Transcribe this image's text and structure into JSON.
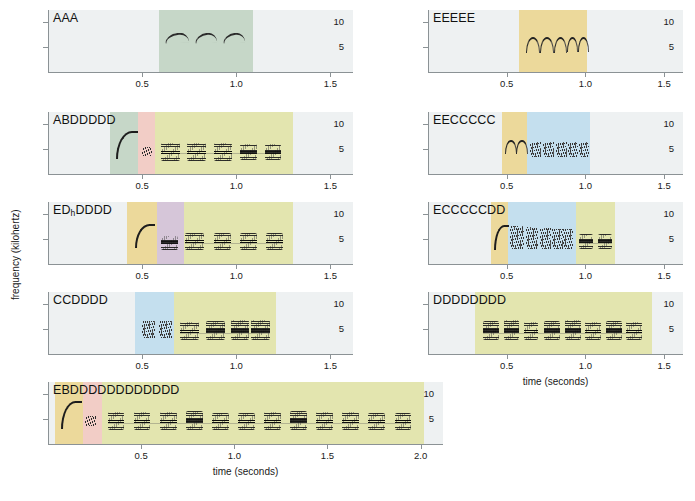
{
  "figure": {
    "xlabel": "time (seconds)",
    "ylabel": "frequency (kilohertz)",
    "y_ticks": [
      "10",
      "5"
    ],
    "x_ticks_short": [
      "0.5",
      "1.0",
      "1.5"
    ],
    "x_ticks_long": [
      "0.5",
      "1.0",
      "1.5",
      "2.0"
    ]
  },
  "colors": {
    "background": "#eef1f2",
    "A": "#c6d7c8",
    "B": "#f2cdc6",
    "C": "#c4dfee",
    "D": "#e3e5af",
    "Dh": "#d6c6d9",
    "E": "#ecd99b",
    "axis": "#8b9295",
    "ink": "#222222"
  },
  "chart_data": {
    "type": "heatmap",
    "title": "",
    "xlabel": "time (seconds)",
    "ylabel": "frequency (kilohertz)",
    "ylim": [
      0,
      12
    ],
    "grid": false,
    "legend": "none",
    "panels": [
      {
        "id": "panel-aaa",
        "label": "AAA",
        "column": "left",
        "row": 1,
        "xlim": [
          0,
          1.62
        ],
        "x_ticks": [
          0.5,
          1.0,
          1.5
        ],
        "y_ticks": [
          10,
          5
        ],
        "syllables": [
          {
            "type": "A",
            "start": 0.62,
            "end": 0.74,
            "freq_low": 6.2,
            "freq_high": 7.8
          },
          {
            "type": "A",
            "start": 0.78,
            "end": 0.89,
            "freq_low": 6.2,
            "freq_high": 7.8
          },
          {
            "type": "A",
            "start": 0.93,
            "end": 1.04,
            "freq_low": 6.2,
            "freq_high": 7.8
          }
        ],
        "regions": [
          {
            "type": "A",
            "start": 0.59,
            "end": 1.09,
            "color": "#c6d7c8"
          }
        ]
      },
      {
        "id": "panel-eeeee",
        "label": "EEEEE",
        "column": "right",
        "row": 1,
        "xlim": [
          0,
          1.62
        ],
        "x_ticks": [
          0.5,
          1.0,
          1.5
        ],
        "y_ticks": [
          10,
          5
        ],
        "syllables": [
          {
            "type": "E",
            "start": 0.62,
            "end": 0.7,
            "freq_low": 4.2,
            "freq_high": 7.0
          },
          {
            "type": "E",
            "start": 0.71,
            "end": 0.79,
            "freq_low": 4.2,
            "freq_high": 7.0
          },
          {
            "type": "E",
            "start": 0.8,
            "end": 0.87,
            "freq_low": 4.2,
            "freq_high": 7.0
          },
          {
            "type": "E",
            "start": 0.88,
            "end": 0.94,
            "freq_low": 4.4,
            "freq_high": 7.0
          },
          {
            "type": "E",
            "start": 0.95,
            "end": 1.01,
            "freq_low": 4.4,
            "freq_high": 7.0
          }
        ],
        "regions": [
          {
            "type": "E",
            "start": 0.58,
            "end": 1.01,
            "color": "#ecd99b"
          }
        ]
      },
      {
        "id": "panel-abddddd",
        "label": "ABDDDDD",
        "column": "left",
        "row": 2,
        "xlim": [
          0,
          1.62
        ],
        "x_ticks": [
          0.5,
          1.0,
          1.5
        ],
        "y_ticks": [
          10,
          5
        ],
        "syllables": [
          {
            "type": "Along",
            "start": 0.36,
            "end": 0.47,
            "freq_low": 3.4,
            "freq_high": 8.6
          },
          {
            "type": "B",
            "start": 0.5,
            "end": 0.55,
            "freq_low": 3.6,
            "freq_high": 5.4
          },
          {
            "type": "D",
            "start": 0.6,
            "end": 0.7,
            "freq_low": 2.6,
            "freq_high": 6.3
          },
          {
            "type": "D",
            "start": 0.74,
            "end": 0.84,
            "freq_low": 2.6,
            "freq_high": 6.3
          },
          {
            "type": "D",
            "start": 0.88,
            "end": 0.98,
            "freq_low": 2.6,
            "freq_high": 6.3
          },
          {
            "type": "D",
            "start": 1.02,
            "end": 1.11,
            "freq_low": 2.8,
            "freq_high": 6.0
          },
          {
            "type": "D",
            "start": 1.15,
            "end": 1.24,
            "freq_low": 2.8,
            "freq_high": 6.0
          }
        ],
        "regions": [
          {
            "type": "A",
            "start": 0.33,
            "end": 0.48,
            "color": "#c6d7c8"
          },
          {
            "type": "B",
            "start": 0.48,
            "end": 0.57,
            "color": "#f2cdc6"
          },
          {
            "type": "D",
            "start": 0.57,
            "end": 1.3,
            "color": "#e3e5af"
          }
        ]
      },
      {
        "id": "panel-eeccccc",
        "label": "EECCCCC",
        "column": "right",
        "row": 2,
        "xlim": [
          0,
          1.62
        ],
        "x_ticks": [
          0.5,
          1.0,
          1.5
        ],
        "y_ticks": [
          10,
          5
        ],
        "syllables": [
          {
            "type": "E",
            "start": 0.49,
            "end": 0.55,
            "freq_low": 4.4,
            "freq_high": 6.8
          },
          {
            "type": "E",
            "start": 0.56,
            "end": 0.62,
            "freq_low": 4.4,
            "freq_high": 6.8
          },
          {
            "type": "C",
            "start": 0.65,
            "end": 0.72,
            "freq_low": 3.4,
            "freq_high": 6.4
          },
          {
            "type": "C",
            "start": 0.73,
            "end": 0.8,
            "freq_low": 3.4,
            "freq_high": 6.4
          },
          {
            "type": "C",
            "start": 0.81,
            "end": 0.88,
            "freq_low": 3.4,
            "freq_high": 6.4
          },
          {
            "type": "C",
            "start": 0.89,
            "end": 0.95,
            "freq_low": 3.4,
            "freq_high": 6.4
          },
          {
            "type": "C",
            "start": 0.96,
            "end": 1.02,
            "freq_low": 3.4,
            "freq_high": 6.4
          }
        ],
        "regions": [
          {
            "type": "E",
            "start": 0.47,
            "end": 0.63,
            "color": "#ecd99b"
          },
          {
            "type": "C",
            "start": 0.63,
            "end": 1.03,
            "color": "#c4dfee"
          }
        ]
      },
      {
        "id": "panel-edhdddd",
        "label": "ED",
        "label_sub": "h",
        "label_tail": "DDDD",
        "label_full": "EDhDDDD",
        "column": "left",
        "row": 3,
        "xlim": [
          0,
          1.62
        ],
        "x_ticks": [
          0.5,
          1.0,
          1.5
        ],
        "y_ticks": [
          10,
          5
        ],
        "syllables": [
          {
            "type": "Elong",
            "start": 0.46,
            "end": 0.56,
            "freq_low": 3.6,
            "freq_high": 8.0
          },
          {
            "type": "Dh",
            "start": 0.6,
            "end": 0.69,
            "freq_low": 2.8,
            "freq_high": 5.6
          },
          {
            "type": "D",
            "start": 0.73,
            "end": 0.83,
            "freq_low": 2.8,
            "freq_high": 6.2
          },
          {
            "type": "D",
            "start": 0.88,
            "end": 0.97,
            "freq_low": 2.8,
            "freq_high": 6.2
          },
          {
            "type": "D",
            "start": 1.02,
            "end": 1.11,
            "freq_low": 2.8,
            "freq_high": 6.2
          },
          {
            "type": "D",
            "start": 1.16,
            "end": 1.25,
            "freq_low": 2.8,
            "freq_high": 6.2
          }
        ],
        "regions": [
          {
            "type": "E",
            "start": 0.42,
            "end": 0.58,
            "color": "#ecd99b"
          },
          {
            "type": "Dh",
            "start": 0.58,
            "end": 0.72,
            "color": "#d6c6d9"
          },
          {
            "type": "D",
            "start": 0.72,
            "end": 1.3,
            "color": "#e3e5af"
          }
        ]
      },
      {
        "id": "panel-eccccdd",
        "label": "ECCCCCDD",
        "column": "right",
        "row": 3,
        "xlim": [
          0,
          1.62
        ],
        "x_ticks": [
          0.5,
          1.0,
          1.5
        ],
        "y_ticks": [
          10,
          5
        ],
        "syllables": [
          {
            "type": "Elong",
            "start": 0.42,
            "end": 0.5,
            "freq_low": 3.2,
            "freq_high": 7.8
          },
          {
            "type": "C",
            "start": 0.52,
            "end": 0.61,
            "freq_low": 3.0,
            "freq_high": 7.6
          },
          {
            "type": "C",
            "start": 0.62,
            "end": 0.7,
            "freq_low": 3.0,
            "freq_high": 7.4
          },
          {
            "type": "C",
            "start": 0.71,
            "end": 0.78,
            "freq_low": 3.0,
            "freq_high": 7.2
          },
          {
            "type": "C",
            "start": 0.79,
            "end": 0.86,
            "freq_low": 3.0,
            "freq_high": 7.0
          },
          {
            "type": "C",
            "start": 0.86,
            "end": 0.92,
            "freq_low": 3.0,
            "freq_high": 7.0
          },
          {
            "type": "D",
            "start": 0.96,
            "end": 1.05,
            "freq_low": 3.0,
            "freq_high": 6.0
          },
          {
            "type": "D",
            "start": 1.08,
            "end": 1.17,
            "freq_low": 3.0,
            "freq_high": 6.0
          }
        ],
        "regions": [
          {
            "type": "E",
            "start": 0.4,
            "end": 0.51,
            "color": "#ecd99b"
          },
          {
            "type": "C",
            "start": 0.51,
            "end": 0.94,
            "color": "#c4dfee"
          },
          {
            "type": "D",
            "start": 0.94,
            "end": 1.19,
            "color": "#e3e5af"
          }
        ]
      },
      {
        "id": "panel-ccdddd",
        "label": "CCDDDD",
        "column": "left",
        "row": 4,
        "xlim": [
          0,
          1.62
        ],
        "x_ticks": [
          0.5,
          1.0,
          1.5
        ],
        "y_ticks": [
          10,
          5
        ],
        "syllables": [
          {
            "type": "C",
            "start": 0.5,
            "end": 0.57,
            "freq_low": 3.2,
            "freq_high": 6.6
          },
          {
            "type": "C",
            "start": 0.59,
            "end": 0.66,
            "freq_low": 3.2,
            "freq_high": 6.6
          },
          {
            "type": "D",
            "start": 0.7,
            "end": 0.8,
            "freq_low": 2.8,
            "freq_high": 6.4
          },
          {
            "type": "D",
            "start": 0.84,
            "end": 0.94,
            "freq_low": 2.8,
            "freq_high": 6.6
          },
          {
            "type": "D",
            "start": 0.97,
            "end": 1.07,
            "freq_low": 2.8,
            "freq_high": 6.8
          },
          {
            "type": "D",
            "start": 1.08,
            "end": 1.18,
            "freq_low": 2.8,
            "freq_high": 6.8
          }
        ],
        "regions": [
          {
            "type": "C",
            "start": 0.46,
            "end": 0.67,
            "color": "#c4dfee"
          },
          {
            "type": "D",
            "start": 0.67,
            "end": 1.21,
            "color": "#e3e5af"
          }
        ]
      },
      {
        "id": "panel-dddddddd",
        "label": "DDDDDDDD",
        "column": "right",
        "row": 4,
        "xlim": [
          0,
          1.62
        ],
        "x_ticks": [
          0.5,
          1.0,
          1.5
        ],
        "y_ticks": [
          10,
          5
        ],
        "syllables": [
          {
            "type": "D",
            "start": 0.35,
            "end": 0.45,
            "freq_low": 2.8,
            "freq_high": 6.6
          },
          {
            "type": "D",
            "start": 0.48,
            "end": 0.58,
            "freq_low": 2.8,
            "freq_high": 6.8
          },
          {
            "type": "D",
            "start": 0.61,
            "end": 0.7,
            "freq_low": 2.8,
            "freq_high": 6.4
          },
          {
            "type": "D",
            "start": 0.74,
            "end": 0.84,
            "freq_low": 2.8,
            "freq_high": 6.6
          },
          {
            "type": "D",
            "start": 0.87,
            "end": 0.97,
            "freq_low": 2.8,
            "freq_high": 6.8
          },
          {
            "type": "D",
            "start": 1.0,
            "end": 1.1,
            "freq_low": 2.8,
            "freq_high": 6.4
          },
          {
            "type": "D",
            "start": 1.13,
            "end": 1.23,
            "freq_low": 2.8,
            "freq_high": 6.6
          },
          {
            "type": "D",
            "start": 1.26,
            "end": 1.36,
            "freq_low": 2.8,
            "freq_high": 6.4
          }
        ],
        "regions": [
          {
            "type": "D",
            "start": 0.3,
            "end": 1.42,
            "color": "#e3e5af"
          }
        ]
      },
      {
        "id": "panel-ebddddddddddd",
        "label": "EBDDDDDDDDDDDD",
        "column": "bottom",
        "row": 5,
        "xlim": [
          0,
          2.12
        ],
        "x_ticks": [
          0.5,
          1.0,
          1.5,
          2.0
        ],
        "y_ticks": [
          10,
          5
        ],
        "syllables": [
          {
            "type": "Elong",
            "start": 0.07,
            "end": 0.17,
            "freq_low": 3.4,
            "freq_high": 8.6
          },
          {
            "type": "B",
            "start": 0.2,
            "end": 0.26,
            "freq_low": 3.6,
            "freq_high": 5.6
          },
          {
            "type": "D",
            "start": 0.32,
            "end": 0.41,
            "freq_low": 2.8,
            "freq_high": 6.4
          },
          {
            "type": "D",
            "start": 0.46,
            "end": 0.55,
            "freq_low": 2.8,
            "freq_high": 6.4
          },
          {
            "type": "D",
            "start": 0.6,
            "end": 0.69,
            "freq_low": 2.8,
            "freq_high": 6.4
          },
          {
            "type": "D",
            "start": 0.74,
            "end": 0.83,
            "freq_low": 2.8,
            "freq_high": 6.6
          },
          {
            "type": "D",
            "start": 0.88,
            "end": 0.97,
            "freq_low": 2.8,
            "freq_high": 6.2
          },
          {
            "type": "D",
            "start": 1.02,
            "end": 1.11,
            "freq_low": 2.8,
            "freq_high": 6.2
          },
          {
            "type": "D",
            "start": 1.16,
            "end": 1.25,
            "freq_low": 2.8,
            "freq_high": 6.4
          },
          {
            "type": "D",
            "start": 1.3,
            "end": 1.39,
            "freq_low": 2.8,
            "freq_high": 6.6
          },
          {
            "type": "D",
            "start": 1.44,
            "end": 1.53,
            "freq_low": 2.8,
            "freq_high": 6.4
          },
          {
            "type": "D",
            "start": 1.58,
            "end": 1.67,
            "freq_low": 2.8,
            "freq_high": 6.4
          },
          {
            "type": "D",
            "start": 1.72,
            "end": 1.81,
            "freq_low": 2.8,
            "freq_high": 6.2
          },
          {
            "type": "D",
            "start": 1.86,
            "end": 1.95,
            "freq_low": 2.8,
            "freq_high": 6.2
          }
        ],
        "regions": [
          {
            "type": "E",
            "start": 0.04,
            "end": 0.19,
            "color": "#ecd99b"
          },
          {
            "type": "B",
            "start": 0.19,
            "end": 0.29,
            "color": "#f2cdc6"
          },
          {
            "type": "D",
            "start": 0.29,
            "end": 2.02,
            "color": "#e3e5af"
          }
        ]
      }
    ]
  }
}
